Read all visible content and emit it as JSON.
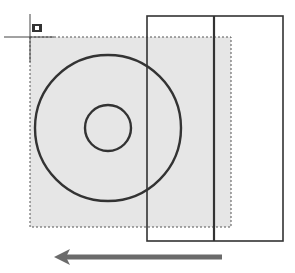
{
  "scene": {
    "description": "CAD crossing-window selection dragged right-to-left over two concentric circles and a rectangle",
    "colors": {
      "background": "#ffffff",
      "selection_fill": "#e6e6e6",
      "selection_border": "#555555",
      "geometry_stroke": "#333333",
      "arrow": "#6b6b6b"
    },
    "cursor": {
      "icon": "crosshair-cursor-icon",
      "pickbox": "selection-pickbox-icon"
    },
    "selection_window": {
      "mode": "crossing",
      "style": "dashed"
    },
    "objects": [
      {
        "type": "circle",
        "name": "outer-circle"
      },
      {
        "type": "circle",
        "name": "inner-circle"
      },
      {
        "type": "rectangle",
        "name": "rectangle"
      },
      {
        "type": "line",
        "name": "vertical-line"
      }
    ],
    "drag_direction": "right-to-left"
  }
}
